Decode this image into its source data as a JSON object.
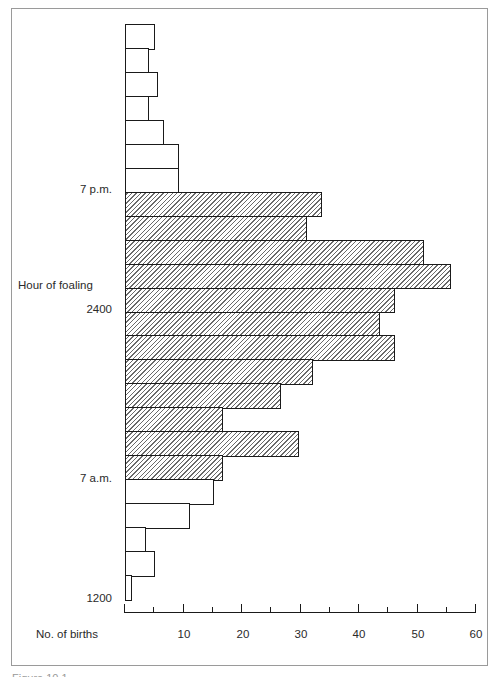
{
  "chart_data": {
    "type": "bar",
    "orientation": "horizontal",
    "title": "",
    "xlabel": "No. of births",
    "ylabel": "Hour of foaling",
    "xlim": [
      0,
      60
    ],
    "x_ticks": [
      10,
      20,
      30,
      40,
      50,
      60
    ],
    "x_minor_tick_step": 5,
    "y_tick_labels": [
      "7 p.m.",
      "2400",
      "7 a.m.",
      "1200"
    ],
    "grid": false,
    "legend": null,
    "bar_order": "top-to-bottom, each bar = 1 hour; top edge = 1200 (noon), bottom edge = 1200 (noon), time runs downward from noon through 7 p.m., 2400, 7 a.m.",
    "categories": [
      "12-13",
      "13-14",
      "14-15",
      "15-16",
      "16-17",
      "17-18",
      "18-19",
      "19-20",
      "20-21",
      "21-22",
      "22-23",
      "23-24",
      "00-01",
      "01-02",
      "02-03",
      "03-04",
      "04-05",
      "05-06",
      "06-07",
      "07-08",
      "08-09",
      "09-10",
      "10-11",
      "11-12"
    ],
    "values": [
      5,
      4,
      5.5,
      4,
      6.5,
      9,
      9,
      33.5,
      31,
      51,
      55.5,
      46,
      43.5,
      46,
      32,
      26.5,
      16.5,
      29.5,
      16.5,
      15,
      11,
      3.5,
      5,
      1
    ],
    "hatched": [
      false,
      false,
      false,
      false,
      false,
      false,
      false,
      true,
      true,
      true,
      true,
      true,
      true,
      true,
      true,
      true,
      true,
      true,
      true,
      false,
      false,
      false,
      false,
      false
    ]
  },
  "labels": {
    "y_axis_title": "Hour of foaling",
    "x_axis_title": "No. of births",
    "y_ticks": [
      {
        "text": "7 p.m.",
        "y": 190
      },
      {
        "text": "2400",
        "y": 310
      },
      {
        "text": "7 a.m.",
        "y": 479
      },
      {
        "text": "1200",
        "y": 599
      }
    ],
    "x_tick_labels": [
      "10",
      "20",
      "30",
      "40",
      "50",
      "60"
    ],
    "caption": "Figure 10.1"
  }
}
